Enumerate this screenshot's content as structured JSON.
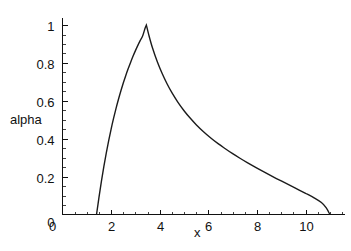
{
  "chart_data": {
    "type": "line",
    "title": "",
    "subtitle": "",
    "xlabel": "x",
    "ylabel": "alpha",
    "xlim": [
      0,
      11.6
    ],
    "ylim": [
      0,
      1.04
    ],
    "grid": false,
    "legend": null,
    "x_ticks": [
      "0",
      "2",
      "4",
      "6",
      "8",
      "10"
    ],
    "x_tick_values": [
      0,
      2,
      4,
      6,
      8,
      10
    ],
    "y_ticks": [
      "0",
      "0.2",
      "0.4",
      "0.6",
      "0.8",
      "1"
    ],
    "y_tick_values": [
      0,
      0.2,
      0.4,
      0.6,
      0.8,
      1
    ],
    "x_minor_step": 0.5,
    "y_minor_step": 0.05,
    "annotations": [
      {
        "name": "peak-cusp",
        "x": 3.45,
        "y": 1,
        "label": ""
      }
    ],
    "series": [
      {
        "name": "alpha",
        "color": "#1b1b1b",
        "x": [
          1.4,
          1.5,
          1.6,
          1.7,
          1.8,
          1.9,
          2.0,
          2.1,
          2.2,
          2.3,
          2.4,
          2.5,
          2.6,
          2.7,
          2.8,
          2.9,
          3.0,
          3.1,
          3.2,
          3.3,
          3.4,
          3.45,
          3.55,
          3.7,
          3.9,
          4.1,
          4.3,
          4.5,
          4.75,
          5.0,
          5.25,
          5.5,
          5.8,
          6.1,
          6.4,
          6.7,
          7.0,
          7.3,
          7.6,
          8.0,
          8.4,
          8.8,
          9.2,
          9.6,
          10.0,
          10.35,
          10.65,
          10.85,
          11.0
        ],
        "y": [
          0.0,
          0.09,
          0.175,
          0.253,
          0.324,
          0.39,
          0.451,
          0.507,
          0.559,
          0.607,
          0.652,
          0.694,
          0.733,
          0.769,
          0.803,
          0.835,
          0.865,
          0.893,
          0.919,
          0.944,
          0.985,
          1.0,
          0.948,
          0.88,
          0.806,
          0.744,
          0.69,
          0.643,
          0.592,
          0.548,
          0.509,
          0.474,
          0.437,
          0.404,
          0.374,
          0.347,
          0.321,
          0.297,
          0.274,
          0.245,
          0.217,
          0.19,
          0.164,
          0.138,
          0.112,
          0.088,
          0.063,
          0.035,
          0.0
        ]
      }
    ]
  },
  "axes": {
    "y_axis_title": "alpha",
    "x_axis_title": "x"
  }
}
